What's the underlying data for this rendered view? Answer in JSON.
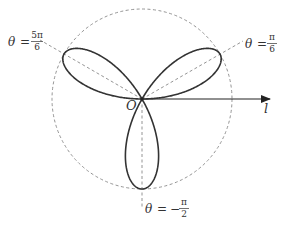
{
  "diagram": {
    "type": "polar three-leaf rose",
    "origin_label": "O",
    "axis_label": "l",
    "colors": {
      "curve": "#333333",
      "dashed": "#888888",
      "axis": "#222222"
    },
    "rays": [
      {
        "id": "ray-pi-6",
        "theta_label_lhs": "θ",
        "theta_label_eq": "=",
        "num": "π",
        "den": "6",
        "sign": ""
      },
      {
        "id": "ray-5pi-6",
        "theta_label_lhs": "θ",
        "theta_label_eq": "=",
        "num": "5π",
        "den": "6",
        "sign": ""
      },
      {
        "id": "ray-minus-pi-2",
        "theta_label_lhs": "θ",
        "theta_label_eq": "=",
        "num": "π",
        "den": "2",
        "sign": "−"
      }
    ]
  }
}
